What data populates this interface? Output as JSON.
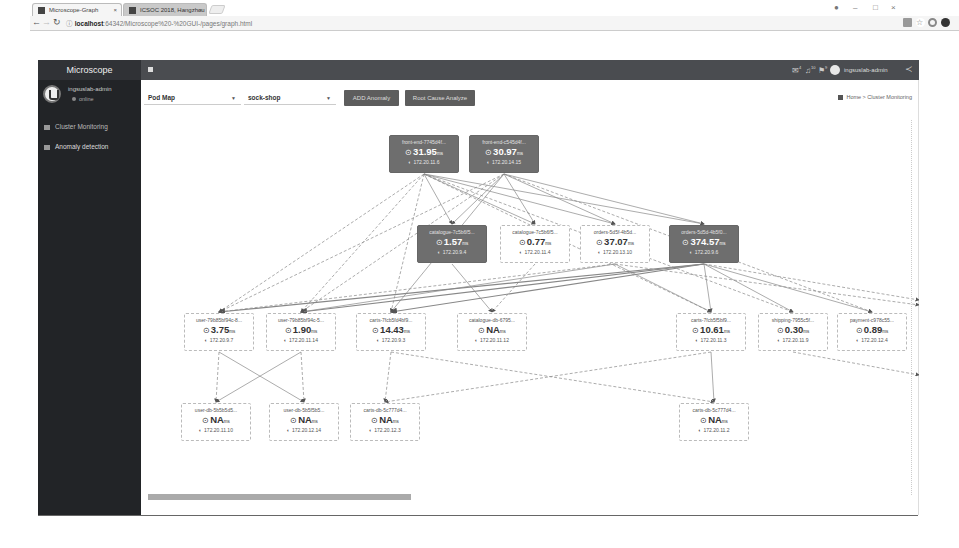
{
  "browser": {
    "tabs": [
      {
        "label": "Microscope-Graph",
        "active": true
      },
      {
        "label": "ICSOC 2018, Hangzhou",
        "active": false
      }
    ],
    "url_host": "localhost",
    "url_path": ":64342/Microscope%20-%20GUI-/pages/graph.html",
    "window_controls": [
      "profile",
      "—",
      "□",
      "×"
    ]
  },
  "app": {
    "brand": "Microscope",
    "user": {
      "name": "ingsuslab-admin",
      "status": "online"
    },
    "sidebar": {
      "items": [
        {
          "label": "Cluster Monitoring",
          "icon": "dashboard-icon"
        },
        {
          "label": "Anomaly detection",
          "icon": "table-icon"
        }
      ]
    },
    "topnav": {
      "notifications": [
        {
          "icon": "envelope-icon",
          "badge": "4"
        },
        {
          "icon": "bell-icon",
          "badge": "10"
        },
        {
          "icon": "flag-icon",
          "badge": "9"
        }
      ],
      "user_label": "ingsuslab-admin"
    }
  },
  "controls": {
    "view_select": "Pod Map",
    "namespace_select": "sock-shop",
    "buttons": [
      "ADD Anomaly",
      "Root Cause Analyze"
    ]
  },
  "breadcrumb": {
    "home": "Home",
    "current": "Cluster Monitoring"
  },
  "graph": {
    "nodes": [
      {
        "id": "fe1",
        "name": "front-end-7745d4f...",
        "latency": "31.95",
        "unit": "ms",
        "ip": "172.20.11.6",
        "hot": true,
        "x": 248,
        "y": 15
      },
      {
        "id": "fe2",
        "name": "front-end-c545d4f...",
        "latency": "30.97",
        "unit": "ms",
        "ip": "172.20.14.15",
        "hot": true,
        "x": 328,
        "y": 15
      },
      {
        "id": "cat1",
        "name": "catalogue-7c5b6f5...",
        "latency": "1.57",
        "unit": "ms",
        "ip": "172.20.9.4",
        "hot": true,
        "x": 276,
        "y": 105
      },
      {
        "id": "cat2",
        "name": "catalogue-7c5b6f5...",
        "latency": "0.77",
        "unit": "ms",
        "ip": "172.20.11.4",
        "hot": false,
        "x": 359,
        "y": 105
      },
      {
        "id": "ord1",
        "name": "orders-5d5f-4b5d...",
        "latency": "37.07",
        "unit": "ms",
        "ip": "172.20.13.10",
        "hot": false,
        "x": 439,
        "y": 105
      },
      {
        "id": "ord2",
        "name": "orders-5d5d-4b5f0...",
        "latency": "374.57",
        "unit": "ms",
        "ip": "172.20.9.6",
        "hot": true,
        "x": 528,
        "y": 105
      },
      {
        "id": "usr1",
        "name": "user-79b85bf94c-8...",
        "latency": "3.75",
        "unit": "ms",
        "ip": "172.20.9.7",
        "hot": false,
        "x": 43,
        "y": 193
      },
      {
        "id": "usr2",
        "name": "user-79b85bf94c-5...",
        "latency": "1.90",
        "unit": "ms",
        "ip": "172.20.11.14",
        "hot": false,
        "x": 125,
        "y": 193
      },
      {
        "id": "crt1",
        "name": "carts-7fcb5fd4bf9...",
        "latency": "14.43",
        "unit": "ms",
        "ip": "172.20.9.3",
        "hot": false,
        "x": 215,
        "y": 193
      },
      {
        "id": "catdb",
        "name": "catalogue-db-6795...",
        "latency": "NA",
        "unit": "ms",
        "ip": "172.20.11.12",
        "hot": false,
        "x": 316,
        "y": 193
      },
      {
        "id": "crt2",
        "name": "carts-7fcb5f5bf9...",
        "latency": "10.61",
        "unit": "ms",
        "ip": "172.20.11.3",
        "hot": false,
        "x": 535,
        "y": 193
      },
      {
        "id": "shp",
        "name": "shipping-7955c5f...",
        "latency": "0.30",
        "unit": "ms",
        "ip": "172.20.11.9",
        "hot": false,
        "x": 617,
        "y": 193
      },
      {
        "id": "pay",
        "name": "payment-c978c55...",
        "latency": "0.89",
        "unit": "ms",
        "ip": "172.20.12.4",
        "hot": false,
        "x": 696,
        "y": 193
      },
      {
        "id": "udb1",
        "name": "user-db-5b5b5d5...",
        "latency": "NA",
        "unit": "ms",
        "ip": "172.20.11.10",
        "hot": false,
        "x": 40,
        "y": 283
      },
      {
        "id": "udb2",
        "name": "user-db-5b5f5b5...",
        "latency": "NA",
        "unit": "ms",
        "ip": "172.20.12.14",
        "hot": false,
        "x": 128,
        "y": 283
      },
      {
        "id": "cdb1",
        "name": "carts-db-5c777d4...",
        "latency": "NA",
        "unit": "ms",
        "ip": "172.20.12.3",
        "hot": false,
        "x": 209,
        "y": 283
      },
      {
        "id": "cdb2",
        "name": "carts-db-5c777d4...",
        "latency": "NA",
        "unit": "ms",
        "ip": "172.20.11.2",
        "hot": false,
        "x": 538,
        "y": 283
      }
    ]
  }
}
